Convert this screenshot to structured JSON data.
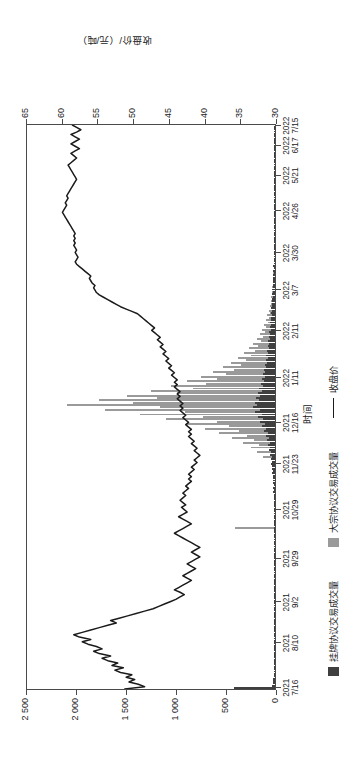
{
  "chart_data": {
    "type": "line",
    "title": "",
    "xlabel": "时间",
    "ylabel_left": "成交量/万吨",
    "ylabel_right": "收盘价/（元/吨）",
    "grid": false,
    "legend_position": "bottom",
    "ylim_left": [
      0,
      2500
    ],
    "ylim_right": [
      30,
      65
    ],
    "yticks_left": [
      "0",
      "500",
      "1 000",
      "1 500",
      "2 000",
      "2 500"
    ],
    "yticks_left_values": [
      0,
      500,
      1000,
      1500,
      2000,
      2500
    ],
    "yticks_right": [
      "30",
      "35",
      "40",
      "45",
      "50",
      "55",
      "60",
      "65"
    ],
    "yticks_right_values": [
      30,
      35,
      40,
      45,
      50,
      55,
      60,
      65
    ],
    "xticks": [
      {
        "year": "2021",
        "day": "7/16"
      },
      {
        "year": "2021",
        "day": "8/10"
      },
      {
        "year": "2021",
        "day": "9/2"
      },
      {
        "year": "2021",
        "day": "9/29"
      },
      {
        "year": "2021",
        "day": "10/29"
      },
      {
        "year": "2021",
        "day": "11/23"
      },
      {
        "year": "2021",
        "day": "12/16"
      },
      {
        "year": "2022",
        "day": "1/11"
      },
      {
        "year": "2022",
        "day": "2/11"
      },
      {
        "year": "2022",
        "day": "3/7"
      },
      {
        "year": "2022",
        "day": "3/30"
      },
      {
        "year": "2022",
        "day": "4/26"
      },
      {
        "year": "2022",
        "day": "5/21"
      },
      {
        "year": "2022",
        "day": "6/17"
      },
      {
        "year": "2022",
        "day": "7/15"
      }
    ],
    "xtick_positions": [
      0.004,
      0.083,
      0.155,
      0.232,
      0.318,
      0.399,
      0.472,
      0.551,
      0.634,
      0.706,
      0.772,
      0.846,
      0.909,
      0.962,
      0.997
    ],
    "series": [
      {
        "name": "挂牌协议交易成交量",
        "key": "listed_volume",
        "type": "bar",
        "color": "#3f3f3f",
        "axis": "left",
        "unit": "万吨",
        "values": [
          410,
          30,
          25,
          18,
          22,
          15,
          12,
          10,
          14,
          9,
          11,
          8,
          13,
          7,
          9,
          6,
          10,
          8,
          5,
          7,
          6,
          9,
          5,
          4,
          6,
          8,
          5,
          7,
          4,
          6,
          5,
          8,
          4,
          6,
          5,
          7,
          4,
          5,
          6,
          4,
          3,
          5,
          6,
          4,
          5,
          7,
          4,
          6,
          5,
          3,
          4,
          6,
          5,
          4,
          7,
          5,
          4,
          6,
          3,
          5,
          4,
          6,
          5,
          7,
          4,
          6,
          8,
          5,
          7,
          6,
          9,
          5,
          8,
          6,
          10,
          7,
          9,
          12,
          8,
          11,
          14,
          9,
          13,
          16,
          11,
          18,
          14,
          20,
          16,
          24,
          19,
          28,
          22,
          32,
          26,
          38,
          30,
          44,
          35,
          52,
          41,
          60,
          47,
          70,
          55,
          82,
          64,
          95,
          74,
          110,
          86,
          128,
          100,
          148,
          116,
          170,
          133,
          196,
          153,
          224,
          176,
          205,
          162,
          188,
          148,
          172,
          135,
          158,
          124,
          145,
          114,
          133,
          105,
          122,
          96,
          112,
          88,
          103,
          81,
          95,
          74,
          87,
          68,
          80,
          63,
          74,
          58,
          68,
          53,
          62,
          49,
          57,
          45,
          52,
          41,
          48,
          38,
          44,
          35,
          40,
          32,
          37,
          29,
          34,
          27,
          31,
          25,
          28,
          22,
          26,
          20,
          24,
          18,
          22,
          17,
          20,
          15,
          18,
          14,
          16,
          13,
          15,
          12,
          14,
          11,
          13,
          10,
          12,
          9,
          11,
          8,
          10,
          8,
          9,
          7,
          9,
          7,
          8,
          6,
          8,
          6,
          7,
          5,
          7,
          5,
          6,
          5,
          6,
          4,
          6,
          5,
          7,
          4,
          6,
          5,
          4,
          6,
          5,
          7,
          4,
          6,
          5,
          8,
          4,
          6,
          5,
          7,
          4,
          6,
          5,
          4,
          6,
          5,
          3,
          5,
          4,
          6,
          4,
          5,
          3
        ]
      },
      {
        "name": "大宗协议交易成交量",
        "key": "block_volume",
        "type": "bar",
        "color": "#9a9a9a",
        "axis": "left",
        "unit": "万吨",
        "values": [
          0,
          0,
          0,
          0,
          0,
          0,
          0,
          0,
          0,
          0,
          0,
          0,
          0,
          0,
          0,
          0,
          0,
          0,
          0,
          0,
          0,
          0,
          0,
          0,
          0,
          0,
          0,
          0,
          0,
          0,
          0,
          0,
          0,
          0,
          0,
          0,
          0,
          0,
          0,
          0,
          0,
          0,
          0,
          0,
          0,
          0,
          0,
          0,
          0,
          0,
          0,
          0,
          0,
          0,
          0,
          0,
          0,
          0,
          0,
          0,
          0,
          0,
          0,
          0,
          0,
          0,
          0,
          0,
          400,
          0,
          0,
          0,
          0,
          0,
          0,
          0,
          0,
          0,
          0,
          0,
          0,
          0,
          0,
          0,
          0,
          0,
          0,
          0,
          0,
          0,
          0,
          0,
          0,
          0,
          0,
          0,
          0,
          0,
          120,
          0,
          180,
          0,
          240,
          160,
          320,
          210,
          430,
          280,
          560,
          360,
          700,
          460,
          880,
          580,
          1090,
          720,
          1350,
          900,
          1700,
          1150,
          2080,
          1420,
          1760,
          1180,
          1480,
          980,
          1240,
          820,
          1040,
          690,
          880,
          580,
          740,
          490,
          620,
          410,
          520,
          345,
          440,
          290,
          370,
          245,
          310,
          205,
          260,
          172,
          218,
          145,
          183,
          122,
          154,
          102,
          129,
          86,
          108,
          72,
          91,
          60,
          76,
          51,
          64,
          42,
          54,
          36,
          45,
          30,
          38,
          25,
          32,
          21,
          27,
          18,
          22,
          15,
          19,
          12,
          16,
          10,
          13,
          9,
          11,
          7,
          9,
          6,
          8,
          5,
          7,
          4,
          6,
          4,
          5,
          3,
          4,
          3,
          4,
          0,
          0,
          0,
          0,
          0,
          0,
          0,
          0,
          0,
          0,
          0,
          0,
          0,
          0,
          0,
          0,
          0,
          0,
          0,
          0,
          0,
          0,
          0,
          0,
          0,
          0,
          0,
          0,
          0,
          0,
          0,
          0,
          0,
          0,
          0,
          0,
          0,
          0,
          0,
          0,
          0,
          0,
          0,
          0,
          0
        ]
      },
      {
        "name": "收盘价",
        "key": "closing_price",
        "type": "line",
        "color": "#1b1b1b",
        "axis": "right",
        "unit": "元/吨",
        "values": [
          51.2,
          48.4,
          49.3,
          50.6,
          49.8,
          51.0,
          50.2,
          51.8,
          52.6,
          51.4,
          53.0,
          52.2,
          53.6,
          54.4,
          53.2,
          54.8,
          55.6,
          54.4,
          55.2,
          56.4,
          57.2,
          56.0,
          57.6,
          58.4,
          57.2,
          56.0,
          54.8,
          53.6,
          52.4,
          53.2,
          52.0,
          50.8,
          49.6,
          48.4,
          47.2,
          46.4,
          45.6,
          44.8,
          44.0,
          43.4,
          42.8,
          43.4,
          44.2,
          43.6,
          43.0,
          42.4,
          41.8,
          42.4,
          43.0,
          42.4,
          41.8,
          41.2,
          41.8,
          42.4,
          41.8,
          41.2,
          40.6,
          41.2,
          41.8,
          41.2,
          40.6,
          41.2,
          41.8,
          42.4,
          43.0,
          43.6,
          44.2,
          43.6,
          43.0,
          42.4,
          41.8,
          42.4,
          43.0,
          43.6,
          43.0,
          42.4,
          42.8,
          43.2,
          42.6,
          43.0,
          43.4,
          43.0,
          42.6,
          43.0,
          42.6,
          42.2,
          42.6,
          42.2,
          41.8,
          42.2,
          41.8,
          42.2,
          41.8,
          41.4,
          41.8,
          41.4,
          41.0,
          41.4,
          41.0,
          40.6,
          41.0,
          41.4,
          41.0,
          41.4,
          41.8,
          41.4,
          41.8,
          42.2,
          41.8,
          42.2,
          41.8,
          42.2,
          42.6,
          42.2,
          42.6,
          43.0,
          42.6,
          43.0,
          43.4,
          43.0,
          43.4,
          43.0,
          43.4,
          43.8,
          43.4,
          43.8,
          43.4,
          43.8,
          44.2,
          43.8,
          44.2,
          43.8,
          44.2,
          44.6,
          44.2,
          44.6,
          45.0,
          44.6,
          45.0,
          45.4,
          45.0,
          45.4,
          45.8,
          45.4,
          45.8,
          46.2,
          45.8,
          46.2,
          46.6,
          46.2,
          46.6,
          47.0,
          47.4,
          47.0,
          47.4,
          47.8,
          48.2,
          48.6,
          49.0,
          49.4,
          50.2,
          51.0,
          51.8,
          52.4,
          53.0,
          53.6,
          54.2,
          54.8,
          55.2,
          55.4,
          55.6,
          55.4,
          55.8,
          56.0,
          56.2,
          56.0,
          56.4,
          56.8,
          57.2,
          57.6,
          58.0,
          58.2,
          58.0,
          57.8,
          58.0,
          58.2,
          58.0,
          58.2,
          58.4,
          58.2,
          58.4,
          58.2,
          58.4,
          58.2,
          58.4,
          58.6,
          58.8,
          59.0,
          59.2,
          59.4,
          59.6,
          59.8,
          60.0,
          59.8,
          59.6,
          59.4,
          59.6,
          59.4,
          59.2,
          59.4,
          59.2,
          59.0,
          58.8,
          58.6,
          58.4,
          58.2,
          58.0,
          58.2,
          58.4,
          58.6,
          58.8,
          59.0,
          59.2,
          58.8,
          58.4,
          58.0,
          58.4,
          58.8,
          58.2,
          57.6,
          58.2,
          58.8,
          58.2,
          57.6,
          58.2,
          58.8,
          58.0,
          57.4,
          58.0,
          58.6
        ]
      }
    ]
  }
}
